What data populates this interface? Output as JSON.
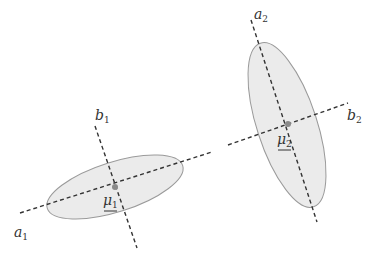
{
  "diagram": {
    "type": "gaussian-clusters-principal-axes",
    "colors": {
      "ellipse_fill": "#ebebeb",
      "ellipse_stroke": "#9a9a9a",
      "axis_line": "#333333",
      "mean_point": "#8a8a8a",
      "text": "#333333"
    },
    "clusters": [
      {
        "id": "cluster-1",
        "center": [
          115,
          187
        ],
        "rx": 71,
        "ry": 25,
        "rotation_deg": -17.5,
        "mean_label": {
          "base": "μ",
          "sub": "1",
          "pos": [
            103,
            205
          ]
        },
        "axis_a": {
          "from": [
            20,
            213
          ],
          "to": [
            212,
            152
          ],
          "label": {
            "base": "a",
            "sub": "1",
            "pos": [
              14,
              237
            ]
          }
        },
        "axis_b": {
          "from": [
            95,
            126
          ],
          "to": [
            137,
            248
          ],
          "label": {
            "base": "b",
            "sub": "1",
            "pos": [
              95,
              120
            ]
          }
        }
      },
      {
        "id": "cluster-2",
        "center": [
          287,
          125
        ],
        "rx": 86,
        "ry": 30,
        "rotation_deg": 72,
        "mean_label": {
          "base": "μ",
          "sub": "2",
          "pos": [
            277,
            144
          ]
        },
        "axis_a": {
          "from": [
            251,
            20
          ],
          "to": [
            317,
            222
          ],
          "label": {
            "base": "a",
            "sub": "2",
            "pos": [
              254,
              19
            ]
          }
        },
        "axis_b": {
          "from": [
            228,
            145
          ],
          "to": [
            348,
            103
          ],
          "label": {
            "base": "b",
            "sub": "2",
            "pos": [
              347,
              120
            ]
          }
        }
      }
    ],
    "extra_segments": [
      {
        "from": [
          209,
          153
        ],
        "to": [
          227,
          146
        ]
      }
    ]
  }
}
